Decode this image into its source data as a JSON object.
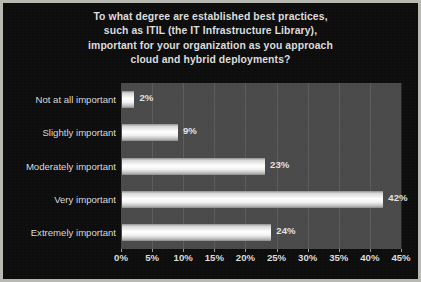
{
  "chart_data": {
    "type": "bar",
    "orientation": "horizontal",
    "title": "To what degree are established best practices, such as ITIL (the IT Infrastructure Library), important for your organization as you approach cloud and hybrid deployments?",
    "title_lines": [
      "To what degree are established best practices,",
      "such as ITIL (the IT Infrastructure Library),",
      "important for your organization as you approach",
      "cloud and hybrid deployments?"
    ],
    "categories": [
      "Not at all important",
      "Slightly important",
      "Moderately important",
      "Very important",
      "Extremely important"
    ],
    "values": [
      2,
      9,
      23,
      42,
      24
    ],
    "value_labels": [
      "2%",
      "9%",
      "23%",
      "42%",
      "24%"
    ],
    "xlabel": "",
    "ylabel": "",
    "xlim": [
      0,
      45
    ],
    "xticks": [
      0,
      5,
      10,
      15,
      20,
      25,
      30,
      35,
      40,
      45
    ],
    "xtick_labels": [
      "0%",
      "5%",
      "10%",
      "15%",
      "20%",
      "25%",
      "30%",
      "35%",
      "40%",
      "45%"
    ],
    "grid": true,
    "legend": null,
    "colors": {
      "background": "#0d0d0d",
      "plot_background": "#4a4a4a",
      "bar": "#ffffff",
      "text": "#dcdcdc",
      "gridline": "#5e5e5e",
      "frame_border": "#b9b9b4"
    }
  }
}
